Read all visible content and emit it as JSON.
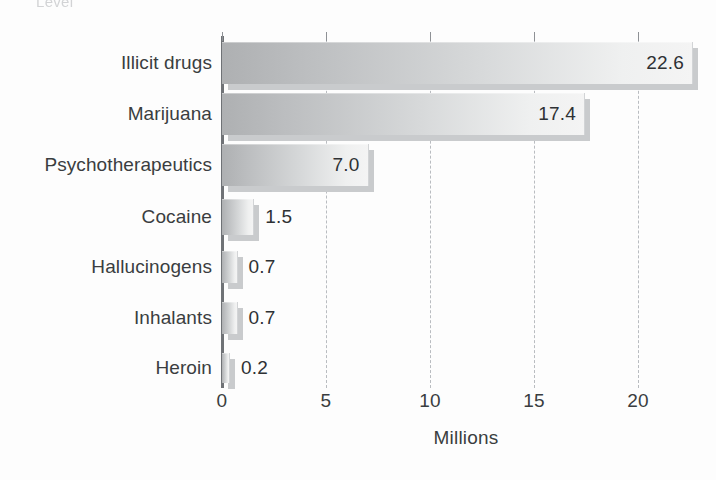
{
  "figure": {
    "cutoff_top_text": "Level",
    "background_color": "#fdfdfd"
  },
  "axis": {
    "x_title": "Millions",
    "x_ticks": [
      "0",
      "5",
      "10",
      "15",
      "20"
    ]
  },
  "style": {
    "bar_gradient_start": "#aeb0b2",
    "bar_gradient_end": "#f4f4f4",
    "bar_shadow_color": "#c9cbcd",
    "axis_color": "#6f7276",
    "gridline_color": "#b9bcc0",
    "text_color": "#3a3d40"
  },
  "chart_data": {
    "type": "bar",
    "orientation": "horizontal",
    "title": "",
    "xlabel": "Millions",
    "ylabel": "",
    "xlim": [
      0,
      22.6
    ],
    "grid": true,
    "legend": null,
    "categories": [
      "Illicit drugs",
      "Marijuana",
      "Psychotherapeutics",
      "Cocaine",
      "Hallucinogens",
      "Inhalants",
      "Heroin"
    ],
    "values": [
      22.6,
      17.4,
      7.0,
      1.5,
      0.7,
      0.7,
      0.2
    ],
    "value_labels": [
      "22.6",
      "17.4",
      "7.0",
      "1.5",
      "0.7",
      "0.7",
      "0.2"
    ],
    "label_placement": [
      "inside",
      "inside",
      "inside",
      "outside",
      "outside",
      "outside",
      "outside"
    ],
    "x_tick_values": [
      0,
      5,
      10,
      15,
      20
    ],
    "x_tick_labels": [
      "0",
      "5",
      "10",
      "15",
      "20"
    ]
  }
}
